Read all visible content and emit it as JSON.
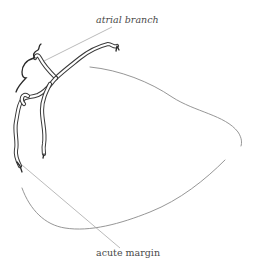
{
  "diagram": {
    "labels": [
      {
        "id": "atrial-branch",
        "text": "atrial branch",
        "style": "italic"
      },
      {
        "id": "acute-margin",
        "text": "acute margin",
        "style": "normal"
      }
    ],
    "colors": {
      "background": "#ffffff",
      "vessel_stroke": "#3a3a3a",
      "outline_stroke": "#8a8a8a",
      "leader_stroke": "#a8a8a8",
      "label_text": "#4a4a4a"
    }
  }
}
